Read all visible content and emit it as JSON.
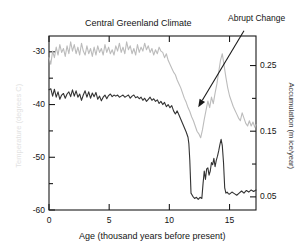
{
  "figure": {
    "title": "Central Greenland Climate",
    "x_axis_title": "Age (thousand years before present)",
    "y_left_title": "Temperature (degrees C)",
    "y_right_title": "Accumulation (m ice/year)",
    "annotation": "Abrupt Change"
  },
  "colors": {
    "temperature_series": "#333333",
    "accumulation_series": "#bcbcbc",
    "axis": "#1a1a1a",
    "annotation_arrow": "#1a1a1a",
    "y_left_title": "#e2e2e2",
    "background": "#ffffff"
  },
  "chart_data": {
    "type": "line",
    "title": "Central Greenland Climate",
    "xlabel": "Age (thousand years before present)",
    "ylabel": "Temperature (degrees C)",
    "y2label": "Accumulation (m ice/year)",
    "xlim": [
      0,
      17.2
    ],
    "ylim": [
      -60,
      -27
    ],
    "y2lim": [
      0.03,
      0.295
    ],
    "xticks": [
      0,
      5,
      10,
      15
    ],
    "xticklabels": [
      "0",
      "5",
      "10",
      "15"
    ],
    "yticks": [
      -30,
      -40,
      -50,
      -60
    ],
    "yticklabels": [
      "-30",
      "-40",
      "-50",
      "-60"
    ],
    "y2ticks": [
      0.25,
      0.15,
      0.05
    ],
    "y2ticklabels": [
      "0.25",
      "0.15",
      "0.05"
    ],
    "grid": false,
    "legend": "none",
    "annotations": [
      {
        "text": "Abrupt Change",
        "target_x": 12.4,
        "target_y": -40.5,
        "label_x": 16.2,
        "label_y": -26.0
      }
    ],
    "series": [
      {
        "name": "Temperature (degrees C)",
        "axis": "left",
        "color": "#333333",
        "units": "degrees C",
        "x": [
          0.0,
          0.15,
          0.3,
          0.45,
          0.6,
          0.75,
          0.9,
          1.05,
          1.2,
          1.35,
          1.5,
          1.65,
          1.8,
          1.95,
          2.1,
          2.25,
          2.4,
          2.55,
          2.7,
          2.85,
          3.0,
          3.15,
          3.3,
          3.45,
          3.6,
          3.75,
          3.9,
          4.05,
          4.2,
          4.35,
          4.5,
          4.65,
          4.8,
          4.95,
          5.1,
          5.25,
          5.4,
          5.55,
          5.7,
          5.85,
          6.0,
          6.15,
          6.3,
          6.45,
          6.6,
          6.75,
          6.9,
          7.05,
          7.2,
          7.35,
          7.5,
          7.65,
          7.8,
          7.95,
          8.1,
          8.25,
          8.4,
          8.55,
          8.7,
          8.85,
          9.0,
          9.15,
          9.3,
          9.45,
          9.6,
          9.75,
          9.9,
          10.05,
          10.2,
          10.35,
          10.5,
          10.65,
          10.8,
          10.95,
          11.1,
          11.25,
          11.4,
          11.55,
          11.62,
          11.7,
          11.8,
          11.95,
          12.1,
          12.25,
          12.4,
          12.55,
          12.7,
          12.8,
          12.9,
          13.0,
          13.1,
          13.2,
          13.3,
          13.4,
          13.5,
          13.6,
          13.7,
          13.8,
          13.9,
          14.0,
          14.1,
          14.2,
          14.3,
          14.4,
          14.5,
          14.6,
          14.7,
          14.8,
          14.9,
          15.0,
          15.2,
          15.4,
          15.6,
          15.8,
          16.0,
          16.2,
          16.4,
          16.6,
          16.8,
          17.0,
          17.2
        ],
        "y": [
          -37.2,
          -37.0,
          -38.4,
          -37.1,
          -38.6,
          -37.6,
          -39.0,
          -38.2,
          -37.9,
          -38.8,
          -38.0,
          -37.6,
          -38.5,
          -37.2,
          -38.4,
          -37.4,
          -38.6,
          -38.0,
          -39.2,
          -38.2,
          -37.4,
          -38.6,
          -37.6,
          -38.8,
          -37.8,
          -38.5,
          -37.7,
          -39.0,
          -38.4,
          -39.3,
          -38.6,
          -38.2,
          -38.9,
          -38.3,
          -38.0,
          -38.5,
          -38.2,
          -38.4,
          -38.2,
          -38.6,
          -38.4,
          -38.2,
          -38.6,
          -38.4,
          -38.2,
          -38.8,
          -38.4,
          -38.2,
          -38.7,
          -38.5,
          -38.9,
          -38.6,
          -39.2,
          -38.8,
          -39.4,
          -39.0,
          -38.6,
          -39.2,
          -38.9,
          -39.4,
          -39.1,
          -39.8,
          -39.4,
          -40.0,
          -39.6,
          -40.4,
          -40.0,
          -40.6,
          -40.2,
          -41.2,
          -41.8,
          -41.2,
          -42.0,
          -42.8,
          -43.6,
          -44.4,
          -45.2,
          -46.2,
          -47.4,
          -50.6,
          -56.8,
          -57.4,
          -57.8,
          -57.6,
          -58.0,
          -57.6,
          -57.8,
          -55.0,
          -52.6,
          -54.2,
          -52.2,
          -52.0,
          -53.4,
          -52.6,
          -51.0,
          -51.4,
          -50.2,
          -51.8,
          -50.6,
          -49.8,
          -48.8,
          -47.6,
          -46.6,
          -47.8,
          -51.0,
          -55.8,
          -56.8,
          -56.6,
          -56.9,
          -57.0,
          -56.6,
          -56.9,
          -57.2,
          -56.8,
          -56.4,
          -56.8,
          -56.3,
          -56.6,
          -56.2,
          -56.5,
          -56.2
        ]
      },
      {
        "name": "Accumulation (m ice/year)",
        "axis": "right",
        "color": "#bcbcbc",
        "units": "m ice/year",
        "x": [
          0.0,
          0.15,
          0.3,
          0.45,
          0.6,
          0.75,
          0.9,
          1.05,
          1.2,
          1.35,
          1.5,
          1.65,
          1.8,
          1.95,
          2.1,
          2.25,
          2.4,
          2.55,
          2.7,
          2.85,
          3.0,
          3.15,
          3.3,
          3.45,
          3.6,
          3.75,
          3.9,
          4.05,
          4.2,
          4.35,
          4.5,
          4.65,
          4.8,
          4.95,
          5.1,
          5.25,
          5.4,
          5.55,
          5.7,
          5.85,
          6.0,
          6.15,
          6.3,
          6.45,
          6.6,
          6.75,
          6.9,
          7.05,
          7.2,
          7.35,
          7.5,
          7.65,
          7.8,
          7.95,
          8.1,
          8.25,
          8.4,
          8.55,
          8.7,
          8.85,
          9.0,
          9.15,
          9.3,
          9.45,
          9.6,
          9.75,
          9.9,
          10.05,
          10.2,
          10.35,
          10.5,
          10.65,
          10.8,
          10.95,
          11.1,
          11.25,
          11.4,
          11.55,
          11.7,
          11.85,
          12.0,
          12.15,
          12.3,
          12.45,
          12.6,
          12.75,
          12.9,
          13.05,
          13.2,
          13.35,
          13.5,
          13.65,
          13.8,
          13.95,
          14.1,
          14.25,
          14.4,
          14.55,
          14.7,
          14.85,
          15.0,
          15.15,
          15.3,
          15.45,
          15.6,
          15.75,
          15.9,
          16.05,
          16.2,
          16.35,
          16.5,
          16.65,
          16.8,
          16.95,
          17.1,
          17.2
        ],
        "y": [
          0.262,
          0.252,
          0.272,
          0.262,
          0.278,
          0.266,
          0.282,
          0.27,
          0.276,
          0.264,
          0.28,
          0.268,
          0.286,
          0.272,
          0.282,
          0.268,
          0.278,
          0.266,
          0.284,
          0.272,
          0.266,
          0.28,
          0.268,
          0.276,
          0.264,
          0.278,
          0.266,
          0.28,
          0.27,
          0.276,
          0.266,
          0.282,
          0.27,
          0.278,
          0.268,
          0.274,
          0.266,
          0.28,
          0.272,
          0.284,
          0.27,
          0.278,
          0.268,
          0.286,
          0.274,
          0.28,
          0.268,
          0.276,
          0.266,
          0.282,
          0.27,
          0.278,
          0.272,
          0.284,
          0.274,
          0.28,
          0.27,
          0.276,
          0.266,
          0.274,
          0.268,
          0.278,
          0.272,
          0.27,
          0.262,
          0.268,
          0.258,
          0.252,
          0.246,
          0.24,
          0.236,
          0.228,
          0.222,
          0.216,
          0.208,
          0.2,
          0.194,
          0.186,
          0.18,
          0.172,
          0.166,
          0.158,
          0.15,
          0.146,
          0.14,
          0.152,
          0.168,
          0.182,
          0.196,
          0.186,
          0.202,
          0.192,
          0.208,
          0.222,
          0.24,
          0.258,
          0.268,
          0.25,
          0.232,
          0.216,
          0.204,
          0.196,
          0.188,
          0.182,
          0.176,
          0.17,
          0.166,
          0.178,
          0.17,
          0.162,
          0.158,
          0.166,
          0.158,
          0.164,
          0.156,
          0.16
        ]
      }
    ]
  },
  "ticks": {
    "left": [
      {
        "label": "-30",
        "value": -30
      },
      {
        "label": "-40",
        "value": -40
      },
      {
        "label": "-50",
        "value": -50
      },
      {
        "label": "-60",
        "value": -60
      }
    ],
    "right": [
      {
        "label": "0.25",
        "value": 0.25
      },
      {
        "label": "0.15",
        "value": 0.15
      },
      {
        "label": "0.05",
        "value": 0.05
      }
    ],
    "bottom": [
      {
        "label": "0",
        "value": 0
      },
      {
        "label": "5",
        "value": 5
      },
      {
        "label": "10",
        "value": 10
      },
      {
        "label": "15",
        "value": 15
      }
    ]
  }
}
